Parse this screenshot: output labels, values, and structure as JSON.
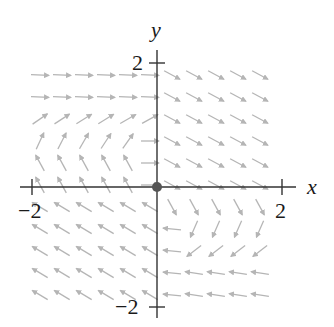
{
  "chart_data": {
    "type": "vector_field",
    "title": "",
    "xlabel": "x",
    "ylabel": "y",
    "xlim": [
      -2.2,
      2.2
    ],
    "ylim": [
      -2.2,
      2.2
    ],
    "x_ticks": [
      {
        "value": -2,
        "label": "−2"
      },
      {
        "value": 2,
        "label": "2"
      }
    ],
    "y_ticks": [
      {
        "value": 2,
        "label": "2"
      },
      {
        "value": -2,
        "label": "−2"
      }
    ],
    "equilibrium_point": {
      "x": 0,
      "y": 0,
      "label": "origin"
    },
    "arrow_color": "#b5b5b5",
    "axis_color": "#333333",
    "grid_spacing_px": 22
  },
  "axes": {
    "x_label": "x",
    "y_label": "y",
    "x_tick_neg": "−2",
    "x_tick_pos": "2",
    "y_tick_pos": "2",
    "y_tick_neg": "−2"
  }
}
